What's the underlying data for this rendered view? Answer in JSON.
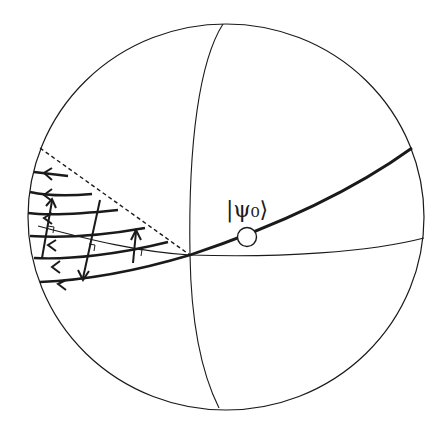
{
  "figure": {
    "type": "bloch-sphere-diagram",
    "state_label": "|ψ₀⟩",
    "elements": {
      "sphere": "outline circle",
      "meridian": "great circle through poles",
      "equator": "thin great circle",
      "geodesic": "thick curve through state point",
      "boundary": "dashed line",
      "flow_lines": 6,
      "transverse_arrows": 4,
      "right_angle_markers": 3
    },
    "colors": {
      "stroke": "#1a1a1a",
      "background": "#ffffff"
    }
  }
}
